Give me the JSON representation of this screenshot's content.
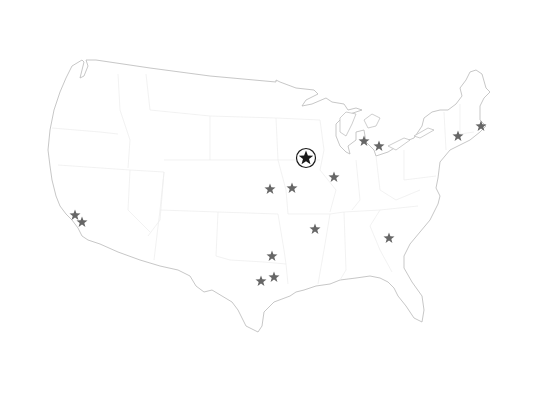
{
  "map": {
    "region": "Contiguous United States",
    "style": "outline with faint state borders",
    "colors": {
      "background": "#ffffff",
      "outline": "#b9b9b9",
      "state_borders": "#ececec",
      "marker": "#666666",
      "hq_marker": "#1a1a1a"
    }
  },
  "hq_marker": {
    "icon": "circled-star-icon",
    "x": 306,
    "y": 158
  },
  "markers": [
    {
      "icon": "star-icon",
      "x": 75,
      "y": 215
    },
    {
      "icon": "star-icon",
      "x": 82,
      "y": 222
    },
    {
      "icon": "star-icon",
      "x": 270,
      "y": 189
    },
    {
      "icon": "star-icon",
      "x": 292,
      "y": 188
    },
    {
      "icon": "star-icon",
      "x": 334,
      "y": 177
    },
    {
      "icon": "star-icon",
      "x": 364,
      "y": 141
    },
    {
      "icon": "star-icon",
      "x": 379,
      "y": 146
    },
    {
      "icon": "star-icon",
      "x": 458,
      "y": 136
    },
    {
      "icon": "star-icon",
      "x": 481,
      "y": 126
    },
    {
      "icon": "star-icon",
      "x": 315,
      "y": 229
    },
    {
      "icon": "star-icon",
      "x": 389,
      "y": 238
    },
    {
      "icon": "star-icon",
      "x": 272,
      "y": 256
    },
    {
      "icon": "star-icon",
      "x": 274,
      "y": 277
    },
    {
      "icon": "star-icon",
      "x": 261,
      "y": 281
    }
  ]
}
